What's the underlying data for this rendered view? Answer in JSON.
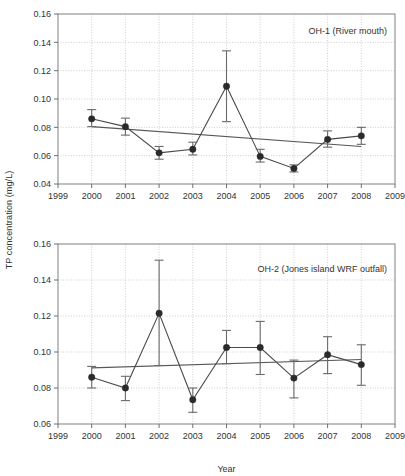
{
  "figure": {
    "ylabel": "TP concentration (mg/L)",
    "xlabel": "Year"
  },
  "chart_data": [
    {
      "type": "line",
      "title": "OH-1 (River mouth)",
      "xlabel": "",
      "ylabel": "TP concentration (mg/L)",
      "grid": true,
      "legend": "none",
      "xlim": [
        1999,
        2009
      ],
      "ylim": [
        0.04,
        0.16
      ],
      "xticks": [
        1999,
        2000,
        2001,
        2002,
        2003,
        2004,
        2005,
        2006,
        2007,
        2008,
        2009
      ],
      "xticklabels": [
        "1999",
        "2000",
        "2001",
        "2002",
        "2003",
        "2004",
        "2005",
        "2006",
        "2007",
        "2008",
        "2009"
      ],
      "yticks": [
        0.04,
        0.06,
        0.08,
        0.1,
        0.12,
        0.14,
        0.16
      ],
      "yticklabels": [
        "0.04",
        "0.06",
        "0.08",
        "0.10",
        "0.12",
        "0.14",
        "0.16"
      ],
      "x": [
        2000,
        2001,
        2002,
        2003,
        2004,
        2005,
        2006,
        2007,
        2008
      ],
      "values": [
        0.086,
        0.0805,
        0.062,
        0.0645,
        0.109,
        0.0595,
        0.051,
        0.0715,
        0.074
      ],
      "err_low": [
        0.0805,
        0.0745,
        0.0575,
        0.0605,
        0.084,
        0.0555,
        0.0485,
        0.066,
        0.068
      ],
      "err_high": [
        0.0925,
        0.0865,
        0.0665,
        0.0695,
        0.134,
        0.0645,
        0.0535,
        0.0775,
        0.08
      ],
      "trend": {
        "x": [
          2000,
          2008
        ],
        "y": [
          0.0805,
          0.0665
        ]
      }
    },
    {
      "type": "line",
      "title": "OH-2 (Jones island WRF outfall)",
      "xlabel": "Year",
      "ylabel": "TP concentration (mg/L)",
      "grid": true,
      "legend": "none",
      "xlim": [
        1999,
        2009
      ],
      "ylim": [
        0.06,
        0.16
      ],
      "xticks": [
        1999,
        2000,
        2001,
        2002,
        2003,
        2004,
        2005,
        2006,
        2007,
        2008,
        2009
      ],
      "xticklabels": [
        "1999",
        "2000",
        "2001",
        "2002",
        "2003",
        "2004",
        "2005",
        "2006",
        "2007",
        "2008",
        "2009"
      ],
      "yticks": [
        0.06,
        0.08,
        0.1,
        0.12,
        0.14,
        0.16
      ],
      "yticklabels": [
        "0.06",
        "0.08",
        "0.10",
        "0.12",
        "0.14",
        "0.16"
      ],
      "x": [
        2000,
        2001,
        2002,
        2003,
        2004,
        2005,
        2006,
        2007,
        2008
      ],
      "values": [
        0.086,
        0.08,
        0.1215,
        0.0735,
        0.1025,
        0.1025,
        0.0855,
        0.0985,
        0.093
      ],
      "err_low": [
        0.08,
        0.073,
        0.0925,
        0.0665,
        0.0935,
        0.0875,
        0.0745,
        0.088,
        0.0815
      ],
      "err_high": [
        0.092,
        0.0865,
        0.151,
        0.08,
        0.112,
        0.117,
        0.0955,
        0.1085,
        0.104
      ],
      "trend": {
        "x": [
          2000,
          2008
        ],
        "y": [
          0.0912,
          0.0958
        ]
      }
    }
  ]
}
